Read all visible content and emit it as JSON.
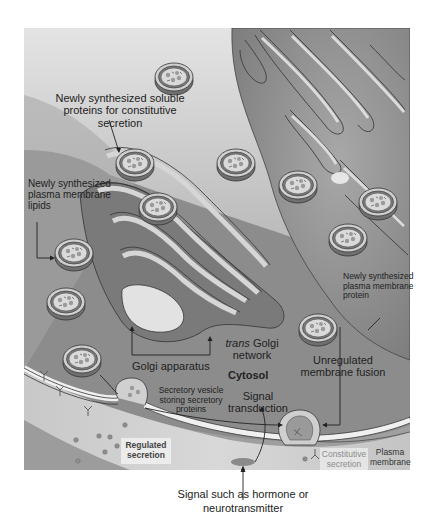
{
  "diagram": {
    "title": "",
    "style": {
      "frame_bg": "#d9d9d9",
      "cytosol": "#8a8a8a",
      "membrane_dark": "#6e6e6e",
      "lumen": "#d4d4d4",
      "line": "#333333"
    },
    "labels": {
      "soluble_proteins": [
        "Newly synthesized soluble",
        "proteins for constitutive",
        "secretion"
      ],
      "pm_lipids": [
        "Newly synthesized",
        "plasma membrane",
        "lipids"
      ],
      "pm_protein": [
        "Newly synthesized",
        "plasma membrane",
        "protein"
      ],
      "golgi_apparatus": "Golgi apparatus",
      "trans_prefix": "trans",
      "trans_golgi": [
        "Golgi",
        "network"
      ],
      "cytosol": "Cytosol",
      "unregulated": [
        "Unregulated",
        "membrane fusion"
      ],
      "secretory_vesicle": [
        "Secretory vesicle",
        "storing secretory",
        "proteins"
      ],
      "signal_transduction": [
        "Signal",
        "transduction"
      ],
      "regulated_secretion": [
        "Regulated",
        "secretion"
      ],
      "constitutive_secretion": [
        "Constitutive",
        "secretion"
      ],
      "plasma_membrane": [
        "Plasma",
        "membrane"
      ],
      "signal_hormone": [
        "Signal such as hormone or",
        "neurotransmitter"
      ]
    }
  }
}
